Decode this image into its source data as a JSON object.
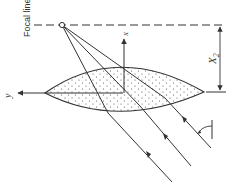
{
  "diagram": {
    "labels": {
      "focal_line": "Focal line",
      "x_axis": "x",
      "y_axis": "y",
      "dimension": "X",
      "dimension_subscript": "2"
    },
    "colors": {
      "stroke": "#333333",
      "fill_dots": "#555555",
      "background": "#ffffff"
    },
    "elements": {
      "focal_point": "focal-point-circle",
      "lens": "lens-shape-stippled",
      "rays_count": 3,
      "angle_marker": "incidence-angle-arc"
    }
  }
}
